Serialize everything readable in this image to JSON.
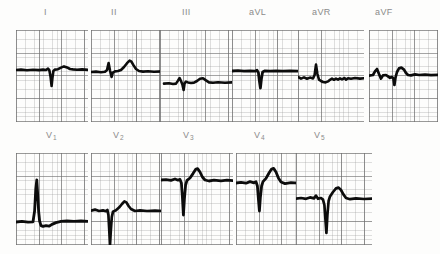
{
  "document": {
    "kind": "12-lead-electrocardiogram-scan",
    "paper": {
      "background_color": "#fdfdfc",
      "fine_grid_color": "#969696",
      "coarse_grid_color": "#6e6e6e",
      "trace_color": "#0c0c0c",
      "label_color": "#8b8b8b",
      "fine_grid_mm_px": 4.55,
      "coarse_grid_mm_px": 22.75
    },
    "rows": [
      {
        "name": "limb-and-augmented-leads",
        "grid_top": 30,
        "grid_height": 92,
        "label_baseline_y": 16,
        "panels": [
          {
            "lead": "I",
            "label": "I",
            "label_sub": "",
            "label_x": 44,
            "x": 16,
            "y": 30,
            "w": 72,
            "h": 92,
            "baseline_y": 40,
            "beats": [
              {
                "t": 34,
                "q": 2,
                "r": -2,
                "s": 17,
                "tw": 0,
                "tw2": 0
              },
              {
                "t": 57,
                "q": 0,
                "r": -4,
                "s": 1,
                "tw": -3,
                "tw2": 0
              }
            ],
            "trace_width": 2.6,
            "path": "M0,40 L5,39.6 L11,40.2 L17,39.7 L23,40.1 L27,39.6 L30,40 L32,38.6 L33.4,40.4 L34.6,47 L35.6,56 L36.4,48 L37.4,41 L39,39.6 L42,39.2 L45,37.6 L48,36.4 L51,37.4 L54,39 L57,39.4 L61,39.8 L66,39.4 L72,39.9"
          },
          {
            "lead": "II",
            "label": "II",
            "label_sub": "",
            "label_x": 111,
            "x": 91,
            "y": 30,
            "w": 72,
            "h": 92,
            "baseline_y": 42,
            "beats": [
              {
                "t": 18,
                "q": 0,
                "r": -9,
                "s": 8,
                "tw": 0,
                "tw2": 0
              },
              {
                "t": 40,
                "q": 0,
                "r": -12,
                "s": 3,
                "tw": 0,
                "tw2": 0
              }
            ],
            "trace_width": 2.6,
            "path": "M0,42 L5,41.6 L10,42.2 L14,41.8 L16,40 L17.6,33 L19,40.5 L20.6,47 L21.8,42.6 L24,41.4 L27,41 L30,40 L33,37 L36,33.2 L38.6,30.6 L40.4,31.6 L42.6,35.4 L45,39 L48,41 L52,41.6 L57,41.2 L63,41.8 L72,41.4"
          },
          {
            "lead": "III",
            "label": "III",
            "label_sub": "",
            "label_x": 182,
            "x": 160,
            "y": 30,
            "w": 72,
            "h": 92,
            "baseline_y": 54,
            "beats": [
              {
                "t": 21,
                "q": 0,
                "r": -6,
                "s": 14,
                "tw": 0,
                "tw2": 0
              },
              {
                "t": 44,
                "q": 0,
                "r": -5,
                "s": 0,
                "tw": 0,
                "tw2": 0
              }
            ],
            "trace_width": 2.6,
            "path": "M4,53.6 L9,53.2 L13,54 L16,53.6 L18,50.6 L19.6,48 L21,51 L22.4,54.4 L23.6,60 L24.6,53.4 L26,51.6 L28,52.4 L31,53 L34,52.6 L37,51 L40,48.8 L43,48.2 L46,50.4 L49,52.4 L53,52.8 L58,52.2 L65,52.8 L72,52.4"
          },
          {
            "lead": "aVL",
            "label": "aVL",
            "label_sub": "",
            "label_x": 249,
            "x": 232,
            "y": 30,
            "w": 66,
            "h": 92,
            "baseline_y": 41,
            "beats": [
              {
                "t": 27,
                "q": 0,
                "r": 0,
                "s": 18,
                "tw": 0,
                "tw2": 0
              }
            ],
            "trace_width": 2.8,
            "path": "M0,41 L6,40.6 L12,41.2 L18,40.8 L23,41.2 L25,40.2 L26.4,42.6 L27.4,51 L28.4,58 L29.4,49 L30.6,42 L33,40.8 L38,41.2 L44,40.8 L51,41.2 L58,40.8 L66,41.2"
          },
          {
            "lead": "aVR",
            "label": "aVR",
            "label_sub": "",
            "label_x": 312,
            "x": 298,
            "y": 30,
            "w": 66,
            "h": 92,
            "baseline_y": 48,
            "beats": [
              {
                "t": 18,
                "q": 0,
                "r": -14,
                "s": 2,
                "tw": 0,
                "tw2": 0
              }
            ],
            "trace_width": 2.6,
            "path": "M0,47 L3,48.6 L6,47.4 L9,48.8 L12,47.6 L15,48.4 L16.6,45 L18,34.6 L19.4,44 L21,49.6 L23,51 L25,52 L27.6,52.4 L30,51.4 L32,49.8 L34,48.6 L36,49.8 L38,48.6 L40,49.6 L42,48.4 L44,49.4 L46.6,48 L48,49.6 L50,48.2 L53,48.8 L57,48 L62,48.6 L66,48.2"
          },
          {
            "lead": "aVF",
            "label": "aVF",
            "label_sub": "",
            "label_x": 375,
            "x": 369,
            "y": 30,
            "w": 69,
            "h": 92,
            "baseline_y": 46,
            "beats": [
              {
                "t": 8,
                "q": 0,
                "r": -7,
                "s": 6,
                "tw": 0,
                "tw2": 0
              },
              {
                "t": 30,
                "q": 0,
                "r": -12,
                "s": 2,
                "tw": 0,
                "tw2": 0
              }
            ],
            "trace_width": 2.7,
            "path": "M0,45.6 L4,45 L6,41.4 L8,39 L10,44 L12,48.6 L14,45.4 L17,45 L19,46.4 L21,47.8 L23,47 L24.4,48.6 L25.4,55 L26.4,48 L28,42 L30,38.4 L32.4,37.6 L35,39.6 L37,43 L39,45 L42,45.4 L46,44.4 L50,45 L56,44.6 L62,45.2 L69,44.8"
          }
        ]
      },
      {
        "name": "precordial-leads",
        "grid_top": 153,
        "grid_height": 92,
        "label_baseline_y": 139,
        "panels": [
          {
            "lead": "V1",
            "label": "V",
            "label_sub": "1",
            "label_x": 46,
            "x": 16,
            "y": 153,
            "w": 72,
            "h": 92,
            "baseline_y": 69,
            "beats": [
              {
                "t": 20,
                "q": 0,
                "r": -27,
                "s": 6,
                "tw": 0,
                "tw2": 0
              }
            ],
            "trace_width": 2.8,
            "path": "M0,69 L6,68.4 L12,69.2 L17,68.8 L18.6,58 L19.8,36 L20.8,27 L21.6,40 L22.6,58 L23.6,68 L25,72.6 L27,73.4 L30,72.6 L33,73.2 L36,71.4 L40,69.6 L45,68.4 L51,68 L58,68.4 L65,68 L72,68.4"
          },
          {
            "lead": "V2",
            "label": "V",
            "label_sub": "2",
            "label_x": 113,
            "x": 91,
            "y": 153,
            "w": 72,
            "h": 92,
            "baseline_y": 58,
            "beats": [
              {
                "t": 18,
                "q": 0,
                "r": 0,
                "s": 42,
                "tw": -10,
                "tw2": 0
              }
            ],
            "trace_width": 2.7,
            "path": "M0,57.6 L4,56.6 L8,58 L12,57.4 L15,58.2 L16.4,57 L17.4,62 L18.2,76 L19,92 L19.8,78 L20.8,64 L22,58.6 L25,57.2 L28,54.6 L31,51 L33.4,48.4 L35.4,49.4 L37.6,53 L40,56 L44,58 L49,57.4 L56,58 L64,57.6 L72,58"
          },
          {
            "lead": "V3",
            "label": "V",
            "label_sub": "3",
            "label_x": 183,
            "x": 161,
            "y": 153,
            "w": 72,
            "h": 92,
            "baseline_y": 27,
            "beats": [
              {
                "t": 22,
                "q": 0,
                "r": 0,
                "s": 38,
                "tw": -14,
                "tw2": 0
              }
            ],
            "trace_width": 2.8,
            "path": "M0,27 L5,26.6 L10,27.4 L14,26 L17,27.2 L19,26.4 L20.4,30 L21.4,44 L22.4,62 L23.4,46 L24.6,32 L26,27.4 L29,25 L32,20.6 L34.6,16.4 L36.6,15.6 L39,19 L41.4,24 L44,27 L48,28 L53,27.2 L60,27.8 L66,27.2 L72,27.6"
          },
          {
            "lead": "V4",
            "label": "V",
            "label_sub": "4",
            "label_x": 254,
            "x": 236,
            "y": 153,
            "w": 72,
            "h": 92,
            "baseline_y": 30,
            "beats": [
              {
                "t": 22,
                "q": 0,
                "r": 0,
                "s": 34,
                "tw": -16,
                "tw2": 0
              }
            ],
            "trace_width": 2.8,
            "path": "M0,30 L5,29.4 L10,30.2 L14,28.6 L18,29.8 L20,28.8 L21.4,33 L22.4,46 L23.4,58 L24.4,44 L25.6,33 L27,28.6 L30,25.4 L33,20 L35.6,16 L37.6,15.4 L40,19 L42.4,25 L45,29 L49,30.6 L55,29.6 L62,30.2 L68,29.6 L72,30"
          },
          {
            "lead": "V5",
            "label": "V",
            "label_sub": "5",
            "label_x": 314,
            "x": 296,
            "y": 153,
            "w": 76,
            "h": 92,
            "baseline_y": 46,
            "beats": [
              {
                "t": 30,
                "q": 0,
                "r": 0,
                "s": 36,
                "tw": -12,
                "tw2": 0
              }
            ],
            "trace_width": 2.7,
            "path": "M0,45.6 L5,45 L10,45.8 L14,44.4 L18,45.4 L20,42.6 L22,45.8 L25,45 L27,46.6 L28.4,52 L29.4,66 L30.4,80 L31.4,62 L32.6,48 L34,43.4 L37,39 L40,35.4 L42.6,34.6 L45,37 L47.4,41.4 L50,45 L54,46.2 L60,45.4 L68,46 L76,45.6"
          }
        ]
      }
    ]
  }
}
